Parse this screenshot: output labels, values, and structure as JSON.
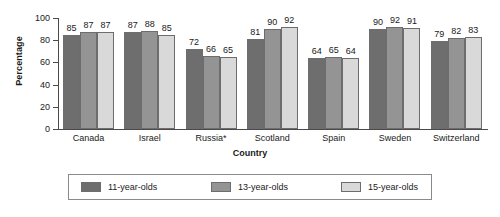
{
  "chart_data": {
    "type": "bar",
    "title": "",
    "xlabel": "Country",
    "ylabel": "Percentage",
    "ylim": [
      0,
      100
    ],
    "yticks": [
      0,
      20,
      40,
      60,
      80,
      100
    ],
    "grid": false,
    "legend_position": "bottom",
    "categories": [
      "Canada",
      "Israel",
      "Russia*",
      "Scotland",
      "Spain",
      "Sweden",
      "Switzerland"
    ],
    "series": [
      {
        "name": "11-year-olds",
        "color": "#6e6e6e",
        "values": [
          85,
          87,
          72,
          81,
          64,
          90,
          79
        ]
      },
      {
        "name": "13-year-olds",
        "color": "#949494",
        "values": [
          87,
          88,
          66,
          90,
          65,
          92,
          82
        ]
      },
      {
        "name": "15-year-olds",
        "color": "#d9d9d9",
        "values": [
          87,
          85,
          65,
          92,
          64,
          91,
          83
        ]
      }
    ],
    "annotations": [
      "*"
    ]
  },
  "axes": {
    "y_title": "Percentage",
    "x_title": "Country",
    "y_tick_labels": [
      "0",
      "20",
      "40",
      "60",
      "80",
      "100"
    ]
  },
  "legend": {
    "items": [
      {
        "label": "11-year-olds"
      },
      {
        "label": "13-year-olds"
      },
      {
        "label": "15-year-olds"
      }
    ]
  }
}
